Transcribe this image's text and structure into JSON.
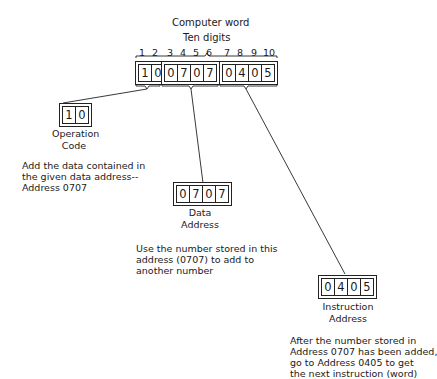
{
  "header": {
    "title": "Computer word",
    "subtitle": "Ten digits"
  },
  "digit_positions": [
    "1",
    "2",
    "3",
    "4",
    "5",
    "6",
    "7",
    "8",
    "9",
    "10"
  ],
  "word": {
    "digits": [
      "1",
      "0",
      "0",
      "7",
      "0",
      "7",
      "0",
      "4",
      "0",
      "5"
    ]
  },
  "parts": {
    "operation": {
      "digits": [
        "1",
        "0"
      ],
      "label_line1": "Operation",
      "label_line2": "Code",
      "description": "Add the data contained in\nthe given data address--\nAddress 0707"
    },
    "data": {
      "digits": [
        "0",
        "7",
        "0",
        "7"
      ],
      "label_line1": "Data",
      "label_line2": "Address",
      "description": "Use the number stored in this\naddress (0707) to add to\nanother number"
    },
    "instruction": {
      "digits": [
        "0",
        "4",
        "0",
        "5"
      ],
      "label_line1": "Instruction",
      "label_line2": "Address",
      "description": "After the number stored in\nAddress 0707 has been added,\ngo to Address 0405 to get\nthe next instruction (word)"
    }
  },
  "colors": {
    "line": "#222222",
    "background": "#ffffff"
  }
}
